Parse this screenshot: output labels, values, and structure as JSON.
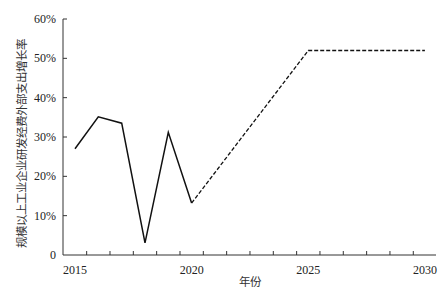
{
  "chart_data": {
    "type": "line",
    "title": "",
    "xlabel": "年份",
    "ylabel": "规模以上工业企业研发经费外部支出增长率",
    "xlim": [
      2014.5,
      2030.5
    ],
    "ylim": [
      0,
      60
    ],
    "x_ticks": [
      2015,
      2020,
      2025,
      2030
    ],
    "y_ticks": [
      0,
      10,
      20,
      30,
      40,
      50,
      60
    ],
    "y_tick_labels": [
      "0",
      "10%",
      "20%",
      "30%",
      "40%",
      "50%",
      "60%"
    ],
    "grid": false,
    "legend": null,
    "series": [
      {
        "name": "actual",
        "style": "solid",
        "x": [
          2015,
          2016,
          2017,
          2018,
          2019,
          2020
        ],
        "values": [
          27.0,
          35.1,
          33.5,
          3.1,
          31.2,
          13.2
        ]
      },
      {
        "name": "projected",
        "style": "dashed",
        "x": [
          2020,
          2025,
          2030
        ],
        "values": [
          13.2,
          52.0,
          52.0
        ]
      }
    ]
  },
  "colors": {
    "line": "#111111",
    "axis": "#333333"
  }
}
